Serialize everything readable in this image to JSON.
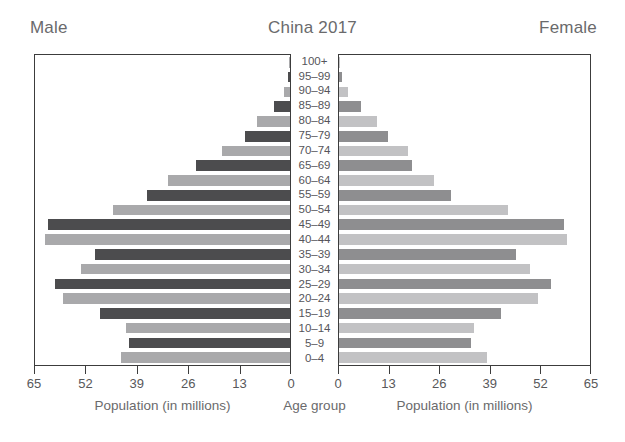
{
  "header": {
    "male_label": "Male",
    "title": "China 2017",
    "female_label": "Female"
  },
  "captions": {
    "left": "Population (in millions)",
    "centre": "Age group",
    "right": "Population (in millions)"
  },
  "axis": {
    "left_ticks": [
      "65",
      "52",
      "39",
      "26",
      "13",
      "0"
    ],
    "right_ticks": [
      "0",
      "13",
      "26",
      "39",
      "52",
      "65"
    ],
    "max": 65,
    "tick_step": 13
  },
  "colors": {
    "bar_dark": "#4c4c4e",
    "bar_light": "#a9a9ab",
    "bar_dark_female": "#8e8e90",
    "bar_light_female": "#c2c2c4",
    "panel_border": "#3c3c3c",
    "text": "#58585a",
    "background": "#ffffff"
  },
  "chart_data": {
    "type": "bar",
    "subtype": "population-pyramid",
    "title": "China 2017",
    "xlabel": "Population (in millions)",
    "ylabel": "Age group",
    "xlim": [
      0,
      65
    ],
    "grid": false,
    "legend_position": "none",
    "categories": [
      "100+",
      "95-99",
      "90-94",
      "85-89",
      "80-84",
      "75-79",
      "70-74",
      "65-69",
      "60-64",
      "55-59",
      "50-54",
      "45-49",
      "40-44",
      "35-39",
      "30-34",
      "25-29",
      "20-24",
      "15-19",
      "10-14",
      "5-9",
      "0-4"
    ],
    "series": [
      {
        "name": "Male",
        "side": "left",
        "values": [
          0.1,
          0.5,
          1.5,
          4.2,
          8.3,
          11.5,
          17.3,
          24.0,
          31.2,
          36.4,
          45.2,
          61.8,
          62.4,
          49.6,
          53.4,
          59.8,
          57.8,
          48.4,
          41.8,
          41.0,
          43.0
        ]
      },
      {
        "name": "Female",
        "side": "right",
        "values": [
          0.2,
          0.9,
          2.4,
          5.6,
          9.9,
          12.8,
          17.9,
          19.0,
          24.5,
          29.0,
          43.8,
          58.2,
          59.0,
          45.8,
          49.4,
          54.8,
          51.5,
          42.0,
          35.0,
          34.2,
          38.3
        ]
      }
    ]
  }
}
